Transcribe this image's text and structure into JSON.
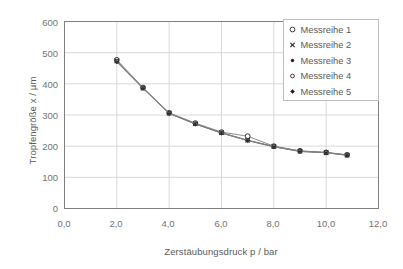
{
  "chart_data": {
    "type": "line",
    "title": "",
    "xlabel": "Zerstäubungsdruck p / bar",
    "ylabel": "Tropfengröße x / µm",
    "xlim": [
      0,
      12
    ],
    "ylim": [
      0,
      600
    ],
    "xticks": [
      "0,0",
      "2,0",
      "4,0",
      "6,0",
      "8,0",
      "10,0",
      "12,0"
    ],
    "xtick_values": [
      0,
      2,
      4,
      6,
      8,
      10,
      12
    ],
    "yticks": [
      "0",
      "100",
      "200",
      "300",
      "400",
      "500",
      "600"
    ],
    "ytick_values": [
      0,
      100,
      200,
      300,
      400,
      500,
      600
    ],
    "grid": "horizontal-and-vertical",
    "legend_position": "top-right",
    "x": [
      2.0,
      3.0,
      4.0,
      5.0,
      6.0,
      7.0,
      8.0,
      9.0,
      10.0,
      10.8
    ],
    "series": [
      {
        "name": "Messreihe 1",
        "marker": "open-circle",
        "values": [
          477,
          388,
          307,
          274,
          245,
          232,
          200,
          185,
          180,
          172
        ]
      },
      {
        "name": "Messreihe 2",
        "marker": "cross",
        "values": [
          474,
          386,
          306,
          272,
          243,
          219,
          199,
          184,
          179,
          171
        ]
      },
      {
        "name": "Messreihe 3",
        "marker": "dot",
        "values": [
          470,
          385,
          305,
          271,
          242,
          218,
          198,
          183,
          179,
          171
        ]
      },
      {
        "name": "Messreihe 4",
        "marker": "open-circle-small",
        "values": [
          473,
          387,
          306,
          272,
          243,
          219,
          199,
          184,
          180,
          172
        ]
      },
      {
        "name": "Messreihe 5",
        "marker": "star",
        "values": [
          471,
          386,
          305,
          271,
          242,
          218,
          198,
          183,
          179,
          171
        ]
      }
    ],
    "colors": {
      "line": "#808080",
      "marker": "#262626",
      "grid": "#d9d9d9",
      "axis": "#808080",
      "text": "#595959",
      "background": "#ffffff"
    }
  }
}
